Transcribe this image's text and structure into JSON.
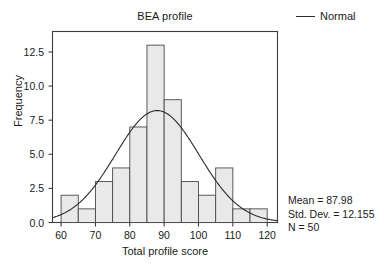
{
  "chart_data": {
    "type": "bar",
    "title": "BEA profile",
    "xlabel": "Total profile score",
    "ylabel": "Frequency",
    "xlim": [
      57.5,
      123
    ],
    "ylim": [
      0,
      14
    ],
    "grid": false,
    "bin_width": 5,
    "bin_starts": [
      60,
      65,
      70,
      75,
      80,
      85,
      90,
      95,
      100,
      105,
      110,
      115
    ],
    "categories": [
      "60-65",
      "65-70",
      "70-75",
      "75-80",
      "80-85",
      "85-90",
      "90-95",
      "95-100",
      "100-105",
      "105-110",
      "110-115",
      "115-120"
    ],
    "values": [
      2,
      1,
      3,
      4,
      7,
      13,
      9,
      3,
      2,
      4,
      1,
      1
    ],
    "xticks": [
      "60",
      "70",
      "80",
      "90",
      "100",
      "110",
      "120"
    ],
    "xtick_values": [
      60,
      70,
      80,
      90,
      100,
      110,
      120
    ],
    "yticks": [
      "0.0",
      "2.5",
      "5.0",
      "7.5",
      "10.0",
      "12.5"
    ],
    "ytick_values": [
      0,
      2.5,
      5,
      7.5,
      10,
      12.5
    ],
    "legend": [
      {
        "label": "Normal",
        "marker": "line"
      }
    ],
    "legend_position": "top-right",
    "overlay_curve": {
      "name": "Normal",
      "mean": 87.98,
      "std_dev": 12.155,
      "n": 50,
      "scale": "count * bin_width"
    },
    "annotations": [
      "Mean = 87.98",
      "Std. Dev. = 12.155",
      "N = 50"
    ],
    "colors": {
      "bar_fill": "#e9e9e9",
      "bar_edge": "#4a4a4a",
      "curve": "#2b2b2b",
      "axis": "#3c3c3c",
      "text": "#1a1a1a",
      "background": "#ffffff"
    }
  },
  "stats": {
    "mean_line": "Mean = 87.98",
    "sd_line": "Std. Dev. = 12.155",
    "n_line": "N = 50"
  },
  "legend": {
    "normal_label": "Normal"
  }
}
